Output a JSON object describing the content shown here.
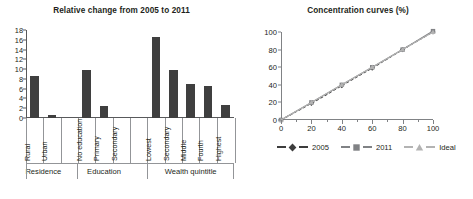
{
  "figure": {
    "panels": [
      "relative-change",
      "concentration-curves"
    ]
  },
  "left_panel": {
    "title": "Relative change from 2005 to 2011",
    "group_labels": [
      "Residence",
      "Education",
      "Wealth quintitle"
    ]
  },
  "right_panel": {
    "title": "Concentration curves (%)",
    "legend": [
      {
        "label": "2005",
        "marker": "diamond",
        "color": "#3d3d3d"
      },
      {
        "label": "2011",
        "marker": "square",
        "color": "#808285"
      },
      {
        "label": "Ideal",
        "marker": "triangle",
        "color": "#b3b3b3"
      }
    ]
  },
  "chart_data": [
    {
      "type": "bar",
      "title": "Relative change from 2005 to 2011",
      "xlabel": "",
      "ylabel": "",
      "ylim": [
        0,
        18
      ],
      "yticks": [
        0,
        2,
        4,
        6,
        8,
        10,
        12,
        14,
        16,
        18
      ],
      "grid": false,
      "bar_color": "#3f3f3f",
      "categories": [
        "Rural",
        "Urban",
        "",
        "No education",
        "Primary",
        "Secondary",
        "",
        "Lowest",
        "Secondary",
        "Middle",
        "Fourth",
        "Highest"
      ],
      "values": [
        8.6,
        0.6,
        null,
        9.8,
        2.5,
        0,
        null,
        16.5,
        9.8,
        7.0,
        6.6,
        2.7
      ],
      "groups": [
        {
          "label": "Residence",
          "categories": [
            "Rural",
            "Urban"
          ],
          "values": [
            8.6,
            0.6
          ]
        },
        {
          "label": "Education",
          "categories": [
            "No education",
            "Primary",
            "Secondary"
          ],
          "values": [
            9.8,
            2.5,
            0
          ]
        },
        {
          "label": "Wealth quintitle",
          "categories": [
            "Lowest",
            "Secondary",
            "Middle",
            "Fourth",
            "Highest"
          ],
          "values": [
            16.5,
            9.8,
            7.0,
            6.6,
            2.7
          ]
        }
      ]
    },
    {
      "type": "line",
      "title": "Concentration curves (%)",
      "xlabel": "",
      "ylabel": "",
      "xlim": [
        0,
        100
      ],
      "ylim": [
        0,
        100
      ],
      "xticks": [
        0,
        20,
        40,
        60,
        80,
        100
      ],
      "yticks": [
        0,
        20,
        40,
        60,
        80,
        100
      ],
      "grid": false,
      "legend_position": "bottom",
      "x": [
        0,
        20,
        40,
        60,
        80,
        100
      ],
      "series": [
        {
          "name": "2005",
          "marker": "diamond",
          "color": "#3d3d3d",
          "values": [
            0,
            19,
            39,
            59,
            80,
            100
          ]
        },
        {
          "name": "2011",
          "marker": "square",
          "color": "#808285",
          "values": [
            0,
            20,
            40,
            60,
            80,
            101
          ]
        },
        {
          "name": "Ideal",
          "marker": "triangle",
          "color": "#b3b3b3",
          "values": [
            0,
            20,
            40,
            60,
            80,
            100
          ]
        }
      ]
    }
  ]
}
